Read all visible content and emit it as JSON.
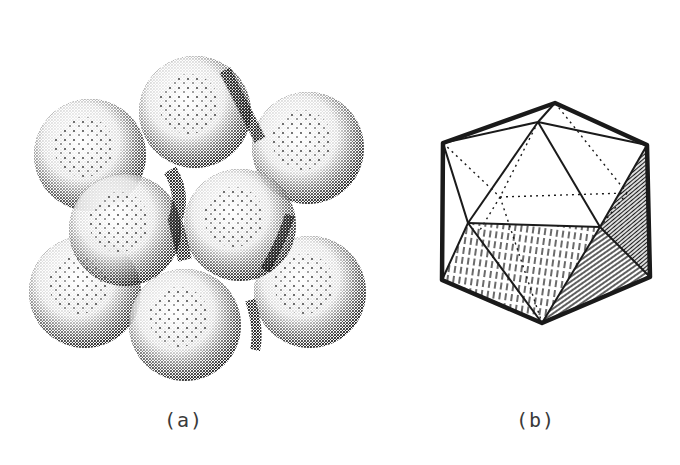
{
  "figure": {
    "panels": [
      {
        "id": "a",
        "label": "(a)",
        "description": "Stippled drawing of a close-packed cluster of spheres",
        "sphere_count_visible": 10
      },
      {
        "id": "b",
        "label": "(b)",
        "description": "Line drawing of an icosahedron with hatched faces and dotted hidden edges"
      }
    ],
    "colors": {
      "ink": "#1a1a1a",
      "background": "#ffffff",
      "label_text": "#3a3a3a"
    }
  }
}
